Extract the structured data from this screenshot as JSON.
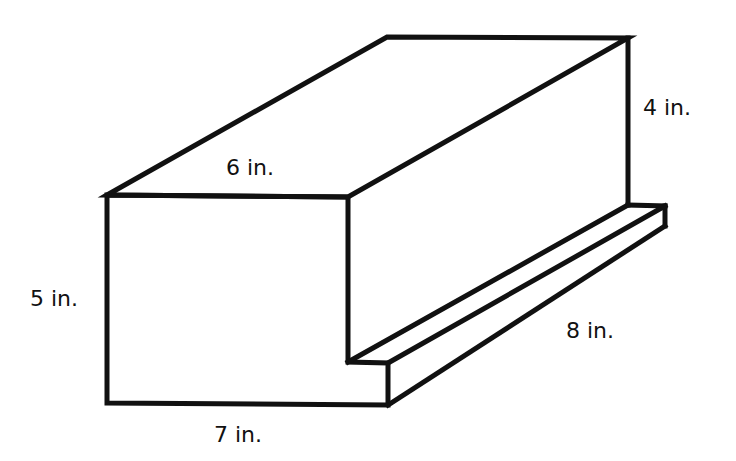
{
  "figure": {
    "type": "3d-solid",
    "line_color": "#111111",
    "background": "#ffffff"
  },
  "labels": {
    "top_depth": "6 in.",
    "back_height": "4 in.",
    "front_height": "5 in.",
    "bottom_width": "7 in.",
    "length": "8 in."
  }
}
